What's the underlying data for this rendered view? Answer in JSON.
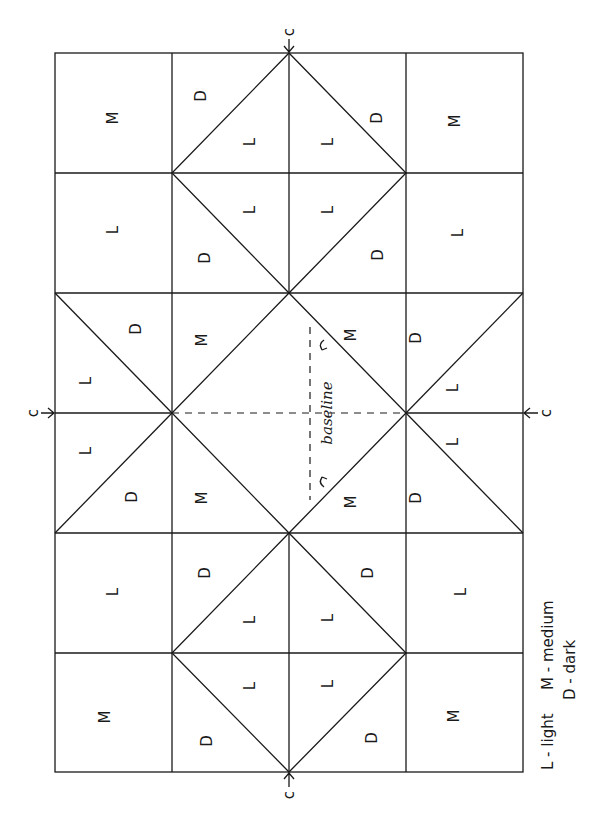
{
  "header": {
    "running_head": ""
  },
  "diagram": {
    "center_marker": "c",
    "baseline_label": "baseline",
    "legend": {
      "light": "L - light",
      "medium": "M - medium",
      "dark": "D - dark"
    },
    "grid": {
      "columns_x": [
        55,
        172,
        289,
        406,
        523
      ],
      "rows_y": [
        53,
        173,
        293,
        413,
        533,
        653,
        772
      ]
    },
    "patches": [
      {
        "id": "r1c1",
        "label": "M"
      },
      {
        "id": "r1c2-top",
        "label": "D"
      },
      {
        "id": "r1c2-bot",
        "label": "L"
      },
      {
        "id": "r1c3-top",
        "label": "D"
      },
      {
        "id": "r1c3-bot",
        "label": "L"
      },
      {
        "id": "r1c4",
        "label": "M"
      },
      {
        "id": "r2c1",
        "label": "L"
      },
      {
        "id": "r2c2-top",
        "label": "L"
      },
      {
        "id": "r2c2-bot",
        "label": "D"
      },
      {
        "id": "r2c3-top",
        "label": "L"
      },
      {
        "id": "r2c3-bot",
        "label": "D"
      },
      {
        "id": "r2c4",
        "label": "L"
      },
      {
        "id": "m-left-upper-D",
        "label": "D"
      },
      {
        "id": "m-left-upper-L",
        "label": "L"
      },
      {
        "id": "m-left-lower-L",
        "label": "L"
      },
      {
        "id": "m-left-lower-D",
        "label": "D"
      },
      {
        "id": "m-c2-upper-M",
        "label": "M"
      },
      {
        "id": "m-c2-lower-M",
        "label": "M"
      },
      {
        "id": "m-c3-upper-M",
        "label": "M"
      },
      {
        "id": "m-c3-lower-M",
        "label": "M"
      },
      {
        "id": "m-right-upper-D",
        "label": "D"
      },
      {
        "id": "m-right-upper-L",
        "label": "L"
      },
      {
        "id": "m-right-lower-L",
        "label": "L"
      },
      {
        "id": "m-right-lower-D",
        "label": "D"
      },
      {
        "id": "r5c1",
        "label": "L"
      },
      {
        "id": "r5c2-top",
        "label": "D"
      },
      {
        "id": "r5c2-bot",
        "label": "L"
      },
      {
        "id": "r5c3-top",
        "label": "D"
      },
      {
        "id": "r5c3-bot",
        "label": "L"
      },
      {
        "id": "r5c4",
        "label": "L"
      },
      {
        "id": "r6c1",
        "label": "M"
      },
      {
        "id": "r6c2-top",
        "label": "L"
      },
      {
        "id": "r6c2-bot",
        "label": "D"
      },
      {
        "id": "r6c3-top",
        "label": "L"
      },
      {
        "id": "r6c3-bot",
        "label": "D"
      },
      {
        "id": "r6c4",
        "label": "M"
      }
    ]
  }
}
